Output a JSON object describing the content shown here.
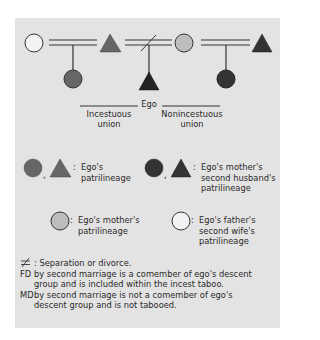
{
  "colors": {
    "panel_bg": "#e3e3e3",
    "ego_patrilineage": "#666666",
    "mother_second_husband_patrilineage": "#333333",
    "mother_patrilineage": "#bdbdbd",
    "father_second_wife_patrilineage": "#f2f2f2",
    "line": "#333333"
  },
  "diagram": {
    "ego_label": "Ego",
    "incestuous_label_line1": "Incestuous",
    "incestuous_label_line2": "union",
    "nonincestuous_label_line1": "Nonincestuous",
    "nonincestuous_label_line2": "union"
  },
  "legend": [
    {
      "icons": [
        "circle",
        "triangle"
      ],
      "color_key": "ego_patrilineage",
      "line1": "Ego's",
      "line2": "patrilineage",
      "line3": ""
    },
    {
      "icons": [
        "circle",
        "triangle"
      ],
      "color_key": "mother_second_husband_patrilineage",
      "line1": "Ego's mother's",
      "line2": "second husband's",
      "line3": "patrilineage"
    },
    {
      "icons": [
        "circle"
      ],
      "color_key": "mother_patrilineage",
      "line1": "Ego's mother's",
      "line2": "patrilineage",
      "line3": ""
    },
    {
      "icons": [
        "circle"
      ],
      "color_key": "father_second_wife_patrilineage",
      "line1": "Ego's father's",
      "line2": "second wife's",
      "line3": "patrilineage"
    }
  ],
  "notes": {
    "separation_text": ": Separation or divorce.",
    "fd_key": "FD",
    "fd_line1": "by second marriage is a comember of ego's descent",
    "fd_line2": "group and is included within the incest taboo.",
    "md_key": "MD",
    "md_line1": "by second marriage is not a comember of ego's",
    "md_line2": "descent group and is not tabooed."
  }
}
